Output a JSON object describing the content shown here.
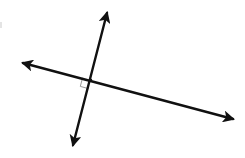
{
  "diagram": {
    "background": "#ffffff",
    "stroke_color": "#111111",
    "marker_color": "#9a9a9a",
    "lines": [
      {
        "id": "line-a",
        "description": "Steep line with arrows at both ends",
        "start": [
          72,
          148
        ],
        "end": [
          108,
          10
        ],
        "arrows": "both"
      },
      {
        "id": "line-b",
        "description": "Shallow line with arrows at both ends",
        "start": [
          20,
          62
        ],
        "end": [
          236,
          120
        ],
        "arrows": "both"
      }
    ],
    "intersection": [
      91,
      80
    ],
    "right_angle_marker": {
      "present": true,
      "position": "lower-left of intersection",
      "size": 9
    }
  }
}
